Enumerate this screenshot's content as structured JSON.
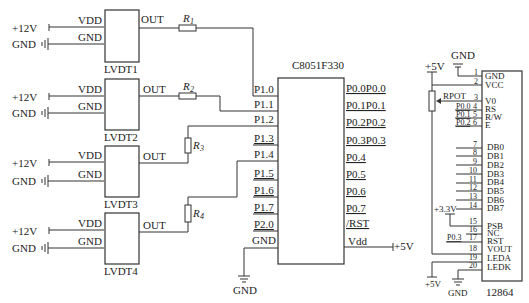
{
  "diagram": {
    "type": "circuit-schematic",
    "lvdt_modules": [
      {
        "id": "LVDT1",
        "label": "LVDT1",
        "supply": "+12V",
        "gnd": "GND",
        "pins": {
          "vdd": "VDD",
          "gnd": "GND",
          "out": "OUT"
        },
        "resistor": "R1",
        "mcu_pin": "P1.0"
      },
      {
        "id": "LVDT2",
        "label": "LVDT2",
        "supply": "+12V",
        "gnd": "GND",
        "pins": {
          "vdd": "VDD",
          "gnd": "GND",
          "out": "OUT"
        },
        "resistor": "R2",
        "mcu_pin": "P1.1"
      },
      {
        "id": "LVDT3",
        "label": "LVDT3",
        "supply": "+12V",
        "gnd": "GND",
        "pins": {
          "vdd": "VDD",
          "gnd": "GND",
          "out": "OUT"
        },
        "resistor": "R3",
        "mcu_pin": "P1.2"
      },
      {
        "id": "LVDT4",
        "label": "LVDT4",
        "supply": "+12V",
        "gnd": "GND",
        "pins": {
          "vdd": "VDD",
          "gnd": "GND",
          "out": "OUT"
        },
        "resistor": "R4",
        "mcu_pin": "P1.4"
      }
    ],
    "resistors": {
      "r1": {
        "main": "R",
        "sub": "1"
      },
      "r2": {
        "main": "R",
        "sub": "2"
      },
      "r3": {
        "main": "R",
        "sub": "3"
      },
      "r4": {
        "main": "R",
        "sub": "4"
      }
    },
    "mcu": {
      "name": "C8051F330",
      "left_pins": [
        "P1.0",
        "P1.1",
        "P1.2",
        "P1.3",
        "P1.4",
        "P1.5",
        "P1.6",
        "P1.7",
        "P2.0",
        "GND"
      ],
      "right_pins": [
        "P0.0P0.0",
        "P0.1P0.1",
        "P0.2P0.2",
        "P0.3P0.3",
        "P0.4",
        "P0.5",
        "P0.6",
        "P0.7",
        "/RST",
        "Vdd"
      ],
      "vdd_supply": "+5V",
      "gnd_label": "GND"
    },
    "lcd": {
      "name": "12864",
      "top_gnd": "GND",
      "top_supply": "+5V",
      "pot_label": "RPOT",
      "pins": [
        {
          "num": "1",
          "name": "GND",
          "net": ""
        },
        {
          "num": "2",
          "name": "VCC",
          "net": ""
        },
        {
          "num": "3",
          "name": "V0",
          "net": ""
        },
        {
          "num": "4",
          "name": "RS",
          "net": "P0.0"
        },
        {
          "num": "5",
          "name": "R/W",
          "net": "P0.1"
        },
        {
          "num": "6",
          "name": "E",
          "net": "P0.2"
        },
        {
          "num": "7",
          "name": "DB0",
          "net": ""
        },
        {
          "num": "8",
          "name": "DB1",
          "net": ""
        },
        {
          "num": "9",
          "name": "DB2",
          "net": ""
        },
        {
          "num": "10",
          "name": "DB3",
          "net": ""
        },
        {
          "num": "11",
          "name": "DB4",
          "net": ""
        },
        {
          "num": "12",
          "name": "DB5",
          "net": ""
        },
        {
          "num": "13",
          "name": "DB6",
          "net": ""
        },
        {
          "num": "14",
          "name": "DB7",
          "net": ""
        },
        {
          "num": "15",
          "name": "PSB",
          "net": ""
        },
        {
          "num": "16",
          "name": "NC",
          "net": ""
        },
        {
          "num": "17",
          "name": "RST",
          "net": "P0.3"
        },
        {
          "num": "18",
          "name": "VOUT",
          "net": ""
        },
        {
          "num": "19",
          "name": "LEDA",
          "net": ""
        },
        {
          "num": "20",
          "name": "LEDK",
          "net": ""
        }
      ],
      "psb_supply": "+3.3V",
      "leda_supply": "+5V",
      "ledk_gnd": "GND"
    }
  }
}
